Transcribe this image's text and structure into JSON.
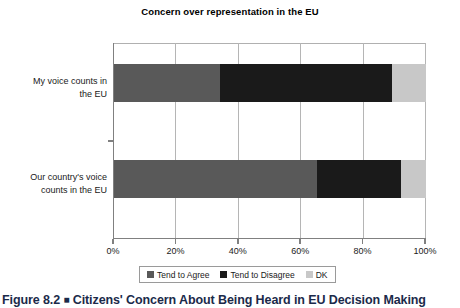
{
  "chart_data": {
    "type": "bar",
    "orientation": "horizontal",
    "stacked": true,
    "title": "Concern over representation in the EU",
    "xlabel": "",
    "ylabel": "",
    "xlim": [
      0,
      100
    ],
    "xtick_labels": [
      "0%",
      "20%",
      "40%",
      "60%",
      "80%",
      "100%"
    ],
    "xtick_values": [
      0,
      20,
      40,
      60,
      80,
      100
    ],
    "grid": true,
    "legend_position": "bottom",
    "categories": [
      "My voice counts in the EU",
      "Our country's voice counts in the EU"
    ],
    "category_lines": [
      [
        "My voice counts in",
        "the EU"
      ],
      [
        "Our country's voice",
        "counts in the EU"
      ]
    ],
    "series": [
      {
        "name": "Tend to Agree",
        "color": "#595959",
        "values": [
          34,
          65
        ]
      },
      {
        "name": "Tend to Disagree",
        "color": "#1a1a1a",
        "values": [
          55,
          27
        ]
      },
      {
        "name": "DK",
        "color": "#c8c8c8",
        "values": [
          11,
          8
        ]
      }
    ]
  },
  "legend": {
    "items": [
      {
        "label": "Tend to Agree",
        "color": "#595959"
      },
      {
        "label": "Tend to Disagree",
        "color": "#1a1a1a"
      },
      {
        "label": "DK",
        "color": "#c8c8c8"
      }
    ]
  },
  "caption": {
    "number": "Figure 8.2",
    "separator": "■",
    "text": "Citizens' Concern About Being Heard in EU Decision Making"
  }
}
